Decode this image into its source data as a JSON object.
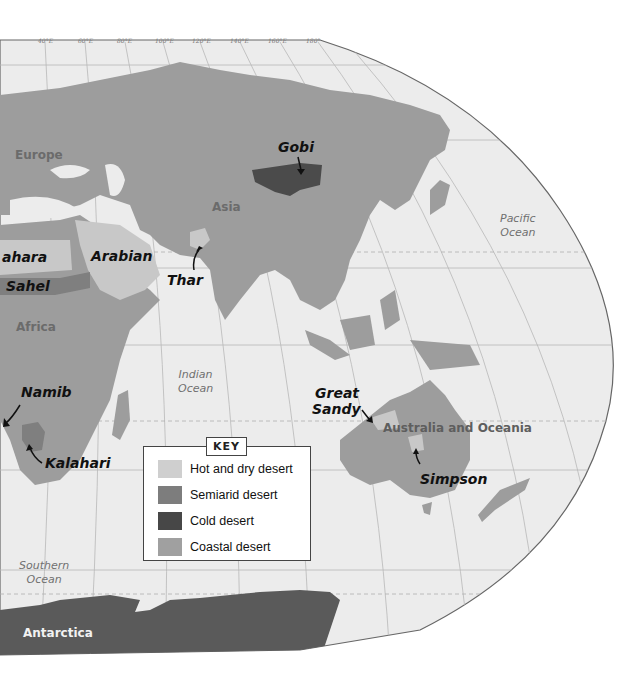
{
  "map": {
    "title": "World Deserts (Eastern Hemisphere)",
    "longitude_ticks": [
      "40°E",
      "60°E",
      "80°E",
      "100°E",
      "120°E",
      "140°E",
      "160°E",
      "180°"
    ],
    "regions": {
      "europe": "Europe",
      "asia": "Asia",
      "africa": "Africa",
      "australia": "Australia and Oceania",
      "antarctica": "Antarctica"
    },
    "oceans": {
      "pacific": [
        "Pacific",
        "Ocean"
      ],
      "indian": [
        "Indian",
        "Ocean"
      ],
      "southern": [
        "Southern",
        "Ocean"
      ]
    },
    "deserts": {
      "gobi": "Gobi",
      "sahara": "ahara",
      "sahel": "Sahel",
      "arabian": "Arabian",
      "thar": "Thar",
      "namib": "Namib",
      "kalahari": "Kalahari",
      "great_sandy_1": "Great",
      "great_sandy_2": "Sandy",
      "simpson": "Simpson"
    },
    "colors": {
      "ocean": "#ececec",
      "land": "#9a9a9a",
      "hot_dry": "#c9c9c9",
      "semiarid": "#7e7e7e",
      "cold": "#4a4a4a",
      "coastal": "#a3a3a3",
      "antarctica": "#5a5a5a"
    }
  },
  "key": {
    "title": "KEY",
    "items": [
      {
        "label": "Hot and dry desert",
        "color": "#cfcfcf"
      },
      {
        "label": "Semiarid desert",
        "color": "#7d7d7d"
      },
      {
        "label": "Cold desert",
        "color": "#474747"
      },
      {
        "label": "Coastal desert",
        "color": "#a0a0a0"
      }
    ]
  }
}
